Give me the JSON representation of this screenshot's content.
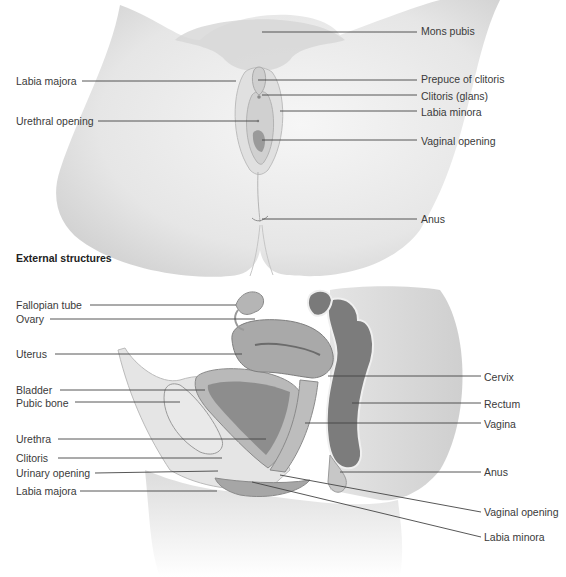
{
  "external": {
    "title": "External structures",
    "labels": [
      {
        "text": "Mons pubis",
        "x": 421,
        "y": 25,
        "side": "right",
        "lx1": 262,
        "ly1": 32,
        "lx2": 417,
        "ly2": 32
      },
      {
        "text": "Labia majora",
        "x": 16,
        "y": 75,
        "side": "left",
        "lx1": 82,
        "ly1": 81,
        "lx2": 236,
        "ly2": 81
      },
      {
        "text": "Prepuce of clitoris",
        "x": 421,
        "y": 73,
        "side": "right",
        "lx1": 258,
        "ly1": 80,
        "lx2": 417,
        "ly2": 80
      },
      {
        "text": "Clitoris (glans)",
        "x": 421,
        "y": 90,
        "side": "right",
        "lx1": 262,
        "ly1": 95,
        "lx2": 417,
        "ly2": 95
      },
      {
        "text": "Labia minora",
        "x": 421,
        "y": 106,
        "side": "right",
        "lx1": 280,
        "ly1": 111,
        "lx2": 417,
        "ly2": 111
      },
      {
        "text": "Urethral opening",
        "x": 16,
        "y": 115,
        "side": "left",
        "lx1": 98,
        "ly1": 121,
        "lx2": 257,
        "ly2": 121
      },
      {
        "text": "Vaginal opening",
        "x": 421,
        "y": 135,
        "side": "right",
        "lx1": 262,
        "ly1": 140,
        "lx2": 417,
        "ly2": 140
      },
      {
        "text": "Anus",
        "x": 421,
        "y": 213,
        "side": "right",
        "lx1": 262,
        "ly1": 219,
        "lx2": 417,
        "ly2": 219
      }
    ]
  },
  "sagittal": {
    "labels": [
      {
        "text": "Fallopian tube",
        "x": 16,
        "y": 299,
        "side": "left",
        "lx1": 90,
        "ly1": 305,
        "lx2": 236,
        "ly2": 305
      },
      {
        "text": "Ovary",
        "x": 16,
        "y": 313,
        "side": "left",
        "lx1": 50,
        "ly1": 319,
        "lx2": 255,
        "ly2": 319
      },
      {
        "text": "Uterus",
        "x": 16,
        "y": 348,
        "side": "left",
        "lx1": 55,
        "ly1": 354,
        "lx2": 242,
        "ly2": 354
      },
      {
        "text": "Bladder",
        "x": 16,
        "y": 384,
        "side": "left",
        "lx1": 60,
        "ly1": 390,
        "lx2": 205,
        "ly2": 390
      },
      {
        "text": "Pubic bone",
        "x": 16,
        "y": 397,
        "side": "left",
        "lx1": 75,
        "ly1": 402,
        "lx2": 180,
        "ly2": 402
      },
      {
        "text": "Urethra",
        "x": 16,
        "y": 433,
        "side": "left",
        "lx1": 58,
        "ly1": 439,
        "lx2": 266,
        "ly2": 439
      },
      {
        "text": "Clitoris",
        "x": 16,
        "y": 456,
        "side": "left",
        "lx1": 58,
        "ly1": 458,
        "lx2": 222,
        "ly2": 458
      },
      {
        "text": "Urinary opening",
        "x": 16,
        "y": 470,
        "side": "left",
        "lx1": 95,
        "ly1": 473,
        "lx2": 218,
        "ly2": 471
      },
      {
        "text": "Labia majora",
        "x": 16,
        "y": 488,
        "side": "left",
        "lx1": 80,
        "ly1": 491,
        "lx2": 217,
        "ly2": 491
      },
      {
        "text": "Cervix",
        "x": 484,
        "y": 371,
        "side": "right",
        "lx1": 328,
        "ly1": 376,
        "lx2": 481,
        "ly2": 376
      },
      {
        "text": "Rectum",
        "x": 484,
        "y": 398,
        "side": "right",
        "lx1": 352,
        "ly1": 403,
        "lx2": 481,
        "ly2": 403
      },
      {
        "text": "Vagina",
        "x": 484,
        "y": 418,
        "side": "right",
        "lx1": 305,
        "ly1": 423,
        "lx2": 481,
        "ly2": 423
      },
      {
        "text": "Anus",
        "x": 484,
        "y": 466,
        "side": "right",
        "lx1": 340,
        "ly1": 472,
        "lx2": 481,
        "ly2": 472
      },
      {
        "text": "Vaginal opening",
        "x": 484,
        "y": 506,
        "side": "right",
        "lx1": 280,
        "ly1": 475,
        "lx2": 481,
        "ly2": 512
      },
      {
        "text": "Labia minora",
        "x": 484,
        "y": 531,
        "side": "right",
        "lx1": 252,
        "ly1": 482,
        "lx2": 481,
        "ly2": 537
      }
    ]
  },
  "colors": {
    "background": "#ffffff",
    "leader_line": "#444444",
    "label_text": "#3a3a3a",
    "skin_light": "#f2f2f2",
    "skin_shade": "#d9d9d9",
    "tissue_mid": "#a8a8a8",
    "tissue_dark": "#7a7a7a"
  }
}
